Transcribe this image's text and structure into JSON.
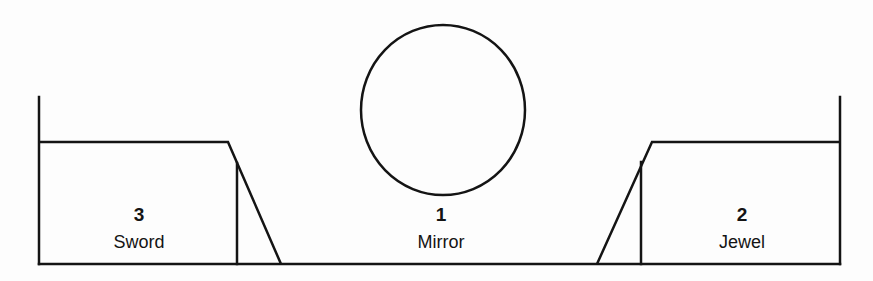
{
  "diagram": {
    "stroke_color": "#141414",
    "background_color": "#ffffff",
    "shapes": {
      "baseline": {
        "x1": 39,
        "y1": 264,
        "x2": 840,
        "y2": 264
      },
      "left_wall": {
        "x1": 39,
        "y1": 97,
        "x2": 39,
        "y2": 264
      },
      "right_wall": {
        "x1": 840,
        "y1": 97,
        "x2": 840,
        "y2": 264
      },
      "left_box": {
        "points": "39,142 228,142 281,264",
        "inner_x": 237,
        "inner_top": 166
      },
      "right_box": {
        "points": "840,142 652,142 597,264",
        "inner_x": 641,
        "inner_top": 164
      },
      "mirror_circle": {
        "cx": 443,
        "cy": 110,
        "rx": 82,
        "ry": 85
      }
    },
    "items": [
      {
        "number": "3",
        "name": "Sword",
        "cx": 139,
        "top": 205
      },
      {
        "number": "1",
        "name": "Mirror",
        "cx": 441,
        "top": 205
      },
      {
        "number": "2",
        "name": "Jewel",
        "cx": 742,
        "top": 205
      }
    ]
  }
}
